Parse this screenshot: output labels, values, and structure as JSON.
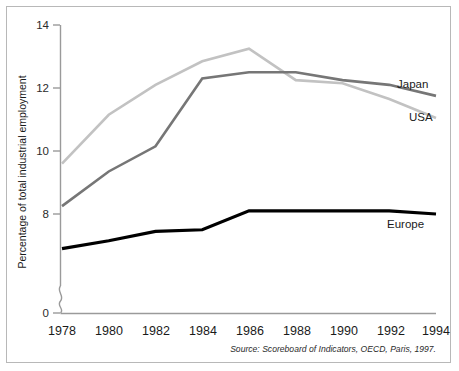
{
  "chart_data": {
    "type": "line",
    "title": "",
    "subtitle": "",
    "xlabel": "",
    "ylabel": "Percentage of total industrial employment",
    "x": [
      1978,
      1980,
      1982,
      1984,
      1986,
      1988,
      1990,
      1992,
      1994
    ],
    "xtick_labels": [
      "1978",
      "1980",
      "1982",
      "1984",
      "1986",
      "1988",
      "1990",
      "1992",
      "1994"
    ],
    "ytick_labels": [
      "14",
      "12",
      "10",
      "8",
      "0"
    ],
    "ytick_values": [
      14,
      12,
      10,
      8,
      0
    ],
    "ylim": [
      6.4,
      14
    ],
    "xlim": [
      1978,
      1994
    ],
    "y_axis_broken": true,
    "grid": false,
    "legend_position": "inline-right",
    "series": [
      {
        "name": "Japan",
        "color": "#767676",
        "values": [
          8.25,
          9.35,
          10.15,
          12.3,
          12.5,
          12.5,
          12.25,
          12.1,
          11.75
        ]
      },
      {
        "name": "USA",
        "color": "#c2c2c2",
        "values": [
          9.6,
          11.15,
          12.1,
          12.85,
          13.25,
          12.25,
          12.15,
          11.65,
          11.05
        ]
      },
      {
        "name": "Europe",
        "color": "#000000",
        "values": [
          6.9,
          7.15,
          7.45,
          7.5,
          8.1,
          8.1,
          8.1,
          8.1,
          8.0
        ]
      }
    ],
    "annotations": {
      "source": "Source: Scoreboard of Indicators, OECD, Paris, 1997."
    }
  },
  "colors": {
    "background": "#ffffff",
    "frame_border": "#b8b8b8",
    "axis": "#9a9a9a",
    "text": "#1a1a1a"
  }
}
